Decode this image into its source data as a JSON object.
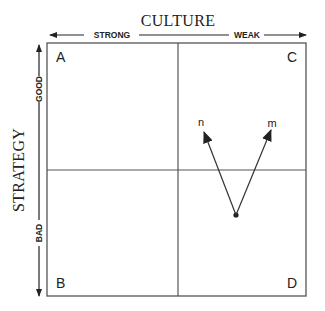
{
  "diagram": {
    "x_axis": {
      "title": "CULTURE",
      "left_label": "STRONG",
      "right_label": "WEAK"
    },
    "y_axis": {
      "title": "STRATEGY",
      "top_label": "GOOD",
      "bottom_label": "BAD"
    },
    "quadrants": {
      "top_left": "A",
      "top_right": "C",
      "bottom_left": "B",
      "bottom_right": "D"
    },
    "vectors": {
      "left_label": "n",
      "right_label": "m"
    },
    "colors": {
      "line": "#555555",
      "text": "#222222",
      "background": "#ffffff"
    }
  }
}
